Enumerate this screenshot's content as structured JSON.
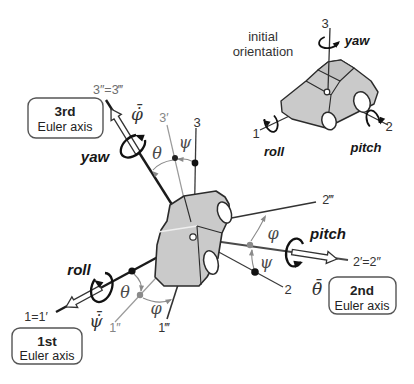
{
  "colors": {
    "background": "#ffffff",
    "car_fill": "#cacaca",
    "car_roof_fill": "#c2c2c2",
    "line_dark": "#1b1b1b",
    "line_medium": "#3a3a3a",
    "line_gray": "#9a9a9a",
    "angle_arc_gray": "#8a8a8a",
    "rotation_arrow": "#111111",
    "open_arrow_fill": "#ffffff"
  },
  "inset": {
    "title_line1": "initial",
    "title_line2": "orientation",
    "axis3_label": "3",
    "axis1_label": "1",
    "axis2_label": "2",
    "yaw_label": "yaw",
    "roll_label": "roll",
    "pitch_label": "pitch"
  },
  "main": {
    "axis3_label": "3",
    "axis3_prime_label": "3′",
    "axis3_dprime_label": "3″=3‴",
    "axis1_label": "1=1′",
    "axis1_dprime_label": "1″",
    "axis1_tprime_label": "1‴",
    "axis2_label": "2",
    "axis2_prime_label": "2′=2″",
    "axis2_tprime_label": "2‴",
    "yaw_label": "yaw",
    "roll_label": "roll",
    "pitch_label": "pitch",
    "phi_rate_label": "φ̇̄",
    "psi_rate_label": "ψ̇̄",
    "theta_rate_label": "θ̇̄",
    "theta_top_label": "θ",
    "psi_top_label": "ψ",
    "theta_left_label": "θ",
    "phi_left_label": "φ",
    "psi_right_label": "ψ",
    "phi_right_label": "φ"
  },
  "callouts": {
    "third": {
      "title": "3rd",
      "subtitle": "Euler axis"
    },
    "first": {
      "title": "1st",
      "subtitle": "Euler axis"
    },
    "second": {
      "title": "2nd",
      "subtitle": "Euler axis"
    }
  }
}
